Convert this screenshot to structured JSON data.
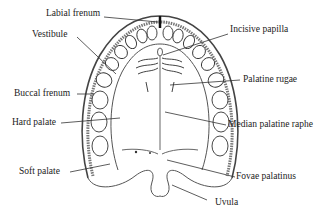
{
  "diagram": {
    "labels": {
      "labial_frenum": "Labial frenum",
      "vestibule": "Vestibule",
      "buccal_frenum": "Buccal frenum",
      "hard_palate": "Hard palate",
      "soft_palate": "Soft palate",
      "incisive_papilla": "Incisive papilla",
      "palatine_rugae": "Palatine rugae",
      "median_palatine_raphe": "Median palatine raphe",
      "fovae_palatinus": "Fovae palatinus",
      "uvula": "Uvula"
    },
    "colors": {
      "line": "#333333",
      "text": "#222222",
      "background": "#ffffff"
    }
  }
}
